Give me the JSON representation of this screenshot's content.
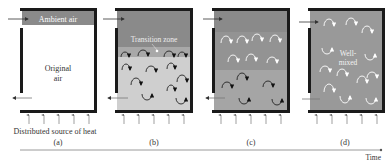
{
  "figure": {
    "panels": [
      {
        "id": "a",
        "caption": "(a)",
        "top_label": "Ambient air",
        "center_label_line1": "Original",
        "center_label_line2": "air",
        "bottom_label": "Distributed source of heat"
      },
      {
        "id": "b",
        "caption": "(b)",
        "zone_label": "Transition zone"
      },
      {
        "id": "c",
        "caption": "(c)"
      },
      {
        "id": "d",
        "caption": "(d)",
        "center_label_line1": "Well-",
        "center_label_line2": "mixed"
      }
    ],
    "time_axis_label": "Time",
    "colors": {
      "wall": "#1a1a1a",
      "ambient_dark_gray": "#8a8a8a",
      "mid_gray": "#a8a8a8",
      "light_gray": "#cfcfcf",
      "well_mixed_gray": "#999999",
      "arrow_gray": "#666666",
      "axis_line": "#9a9a9a"
    }
  }
}
